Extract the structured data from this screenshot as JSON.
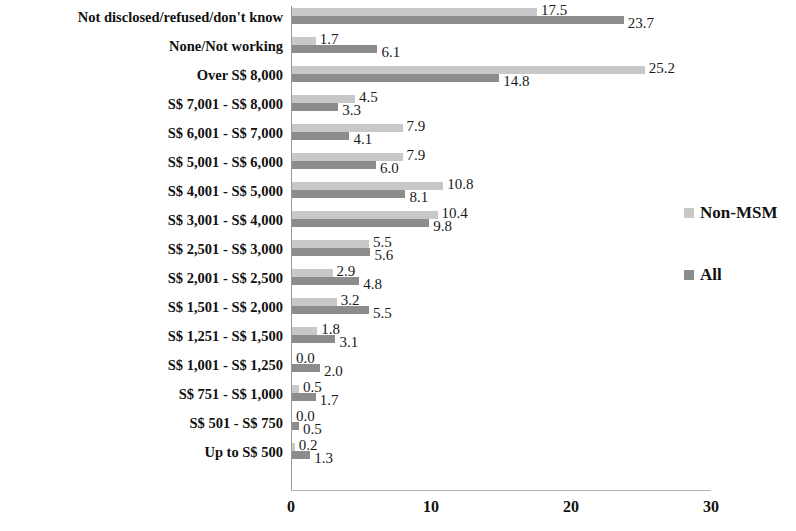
{
  "chart_data": {
    "type": "bar",
    "orientation": "horizontal",
    "title": "",
    "subtitle": "",
    "xlabel": "",
    "ylabel": "",
    "xlim": [
      0,
      30
    ],
    "xticks": [
      0,
      10,
      20,
      30
    ],
    "xtick_labels": [
      "0",
      "10",
      "20",
      "30"
    ],
    "grid": false,
    "legend_position": "right",
    "categories": [
      "Not disclosed/refused/don't know",
      "None/Not working",
      "Over S$ 8,000",
      "S$ 7,001 - S$ 8,000",
      "S$ 6,001 - S$ 7,000",
      "S$ 5,001 - S$ 6,000",
      "S$ 4,001 - S$ 5,000",
      "S$ 3,001 - S$ 4,000",
      "S$ 2,501 - S$ 3,000",
      "S$ 2,001 - S$ 2,500",
      "S$ 1,501 - S$ 2,000",
      "S$ 1,251 - S$ 1,500",
      "S$ 1,001 - S$ 1,250",
      "S$ 751 - S$ 1,000",
      "S$ 501 - S$ 750",
      "Up to S$ 500"
    ],
    "series": [
      {
        "name": "Non-MSM",
        "color": "#c8c8c8",
        "values": [
          17.5,
          1.7,
          25.2,
          4.5,
          7.9,
          7.9,
          10.8,
          10.4,
          5.5,
          2.9,
          3.2,
          1.8,
          0.0,
          0.5,
          0.0,
          0.2
        ],
        "labels": [
          "17.5",
          "1.7",
          "25.2",
          "4.5",
          "7.9",
          "7.9",
          "10.8",
          "10.4",
          "5.5",
          "2.9",
          "3.2",
          "1.8",
          "0.0",
          "0.5",
          "0.0",
          "0.2"
        ]
      },
      {
        "name": "All",
        "color": "#8c8c8c",
        "values": [
          23.7,
          6.1,
          14.8,
          3.3,
          4.1,
          6.0,
          8.1,
          9.8,
          5.6,
          4.8,
          5.5,
          3.1,
          2.0,
          1.7,
          0.5,
          1.3
        ],
        "labels": [
          "23.7",
          "6.1",
          "14.8",
          "3.3",
          "4.1",
          "6.0",
          "8.1",
          "9.8",
          "5.6",
          "4.8",
          "5.5",
          "3.1",
          "2.0",
          "1.7",
          "0.5",
          "1.3"
        ]
      }
    ]
  },
  "legend": {
    "items": [
      {
        "label": "Non-MSM",
        "color": "#c8c8c8"
      },
      {
        "label": "All",
        "color": "#8c8c8c"
      }
    ]
  }
}
